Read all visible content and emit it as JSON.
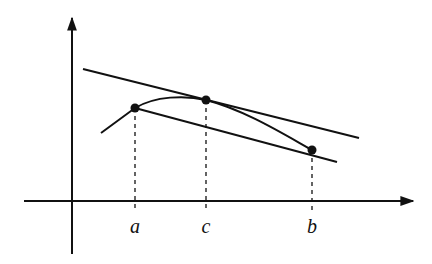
{
  "diagram": {
    "type": "mean-value-theorem-illustration",
    "colors": {
      "stroke": "#111111",
      "background": "#ffffff"
    },
    "axes": {
      "origin": {
        "x": 72,
        "y": 201
      },
      "x_axis": {
        "x1": 24,
        "x2": 413,
        "y": 201
      },
      "y_axis": {
        "x": 72,
        "y1": 254,
        "y2": 18
      }
    },
    "points": [
      {
        "id": "a",
        "label": "a",
        "x": 135,
        "y": 108
      },
      {
        "id": "c",
        "label": "c",
        "x": 206,
        "y": 100
      },
      {
        "id": "b",
        "label": "b",
        "x": 312,
        "y": 150
      }
    ],
    "tick_labels": [
      {
        "text": "a",
        "x": 135,
        "y": 216
      },
      {
        "text": "c",
        "x": 206,
        "y": 216
      },
      {
        "text": "b",
        "x": 312,
        "y": 216
      }
    ],
    "tangent_line": {
      "x1": 83,
      "y1": 69,
      "x2": 359,
      "y2": 138
    },
    "secant_line": {
      "x1": 135,
      "y1": 108,
      "x2": 337,
      "y2": 162
    },
    "curve": {
      "description": "concave curve rising from lower-left through a, peaking near c, descending through b",
      "path": "M 101 133 L 135 108 C 155 96, 185 95, 206 100 C 245 110, 285 135, 312 150"
    },
    "dashed_guides": [
      {
        "x": 135,
        "y1": 108,
        "y2": 212
      },
      {
        "x": 206,
        "y1": 100,
        "y2": 212
      },
      {
        "x": 312,
        "y1": 150,
        "y2": 212
      }
    ]
  }
}
